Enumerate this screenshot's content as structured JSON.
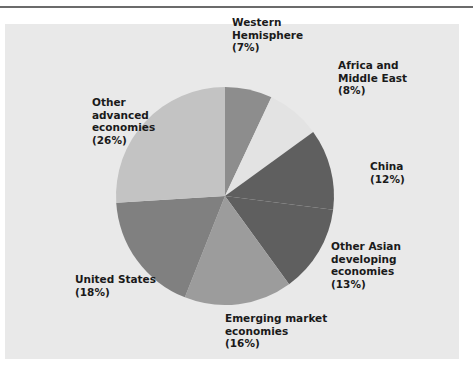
{
  "chart_data": {
    "type": "pie",
    "title": "",
    "start_angle_deg": 0,
    "direction": "clockwise",
    "slices": [
      {
        "label": "Western Hemisphere",
        "value": 7,
        "color": "#8d8d8d"
      },
      {
        "label": "Africa and Middle East",
        "value": 8,
        "color": "#e3e3e3"
      },
      {
        "label": "China",
        "value": 12,
        "color": "#5f5f5f"
      },
      {
        "label": "Other Asian developing economies",
        "value": 13,
        "color": "#5f5f5f"
      },
      {
        "label": "Emerging market economies",
        "value": 16,
        "color": "#9c9c9c"
      },
      {
        "label": "United States",
        "value": 18,
        "color": "#808080"
      },
      {
        "label": "Other advanced economies",
        "value": 26,
        "color": "#c3c3c3"
      }
    ]
  },
  "labels": {
    "western": "Western\nHemisphere\n(7%)",
    "africa": "Africa and\nMiddle East\n(8%)",
    "china": "China\n(12%)",
    "other_asian": "Other Asian\ndeveloping\neconomies\n(13%)",
    "emerging": "Emerging market\neconomies\n(16%)",
    "us": "United States\n(18%)",
    "other_advanced": "Other\nadvanced\neconomies\n(26%)"
  },
  "colors": {
    "panel": "#e9e9e9",
    "rule": "#6b6b6b",
    "text": "#1a1a1a"
  }
}
